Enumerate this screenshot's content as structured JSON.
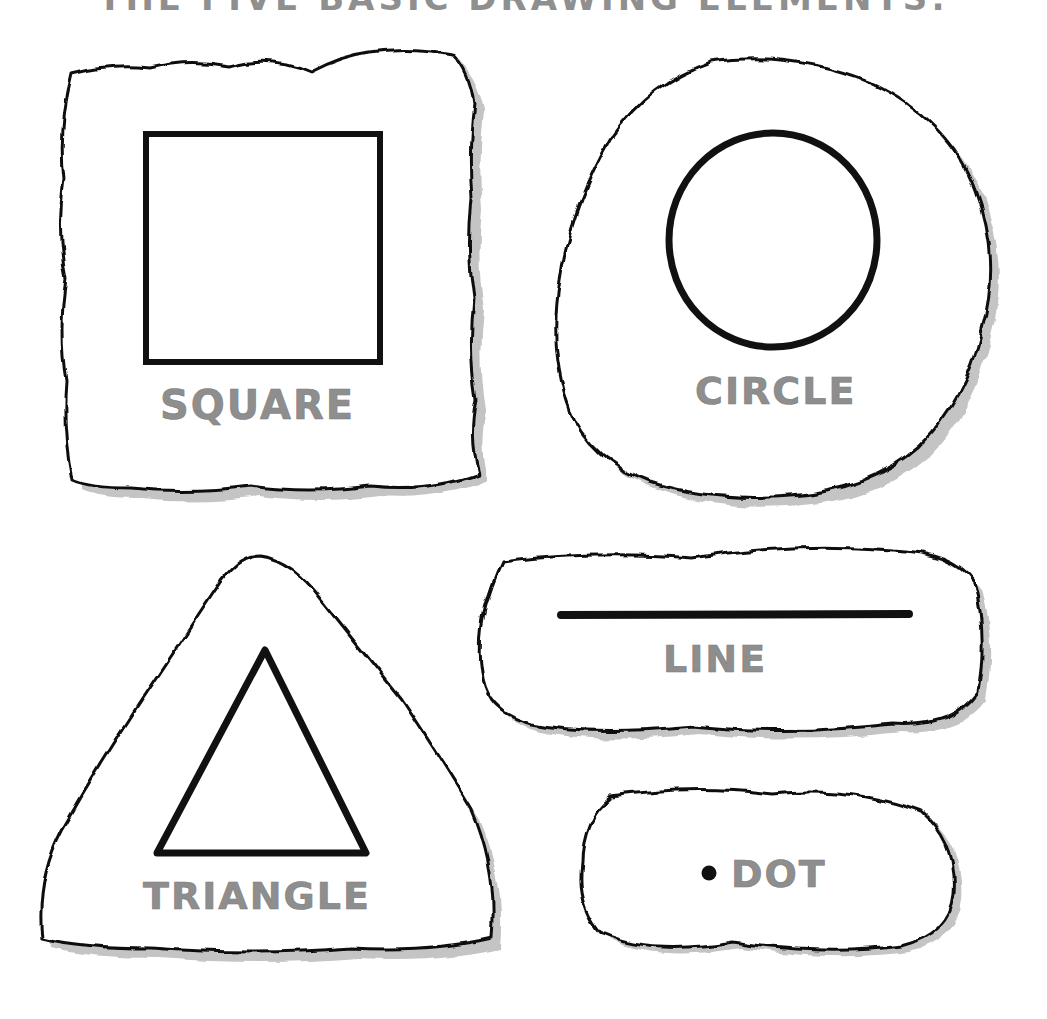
{
  "title": "THE FIVE BASIC DRAWING ELEMENTS:",
  "colors": {
    "outline": "#111111",
    "label": "#8e8e8e",
    "shadow": "#c4c4c4",
    "background": "#ffffff"
  },
  "elements": [
    {
      "id": "square",
      "label": "SQUARE",
      "shape": "square-icon"
    },
    {
      "id": "circle",
      "label": "CIRCLE",
      "shape": "circle-icon"
    },
    {
      "id": "triangle",
      "label": "TRIANGLE",
      "shape": "triangle-icon"
    },
    {
      "id": "line",
      "label": "LINE",
      "shape": "line-icon"
    },
    {
      "id": "dot",
      "label": "DOT",
      "shape": "dot-icon"
    }
  ]
}
